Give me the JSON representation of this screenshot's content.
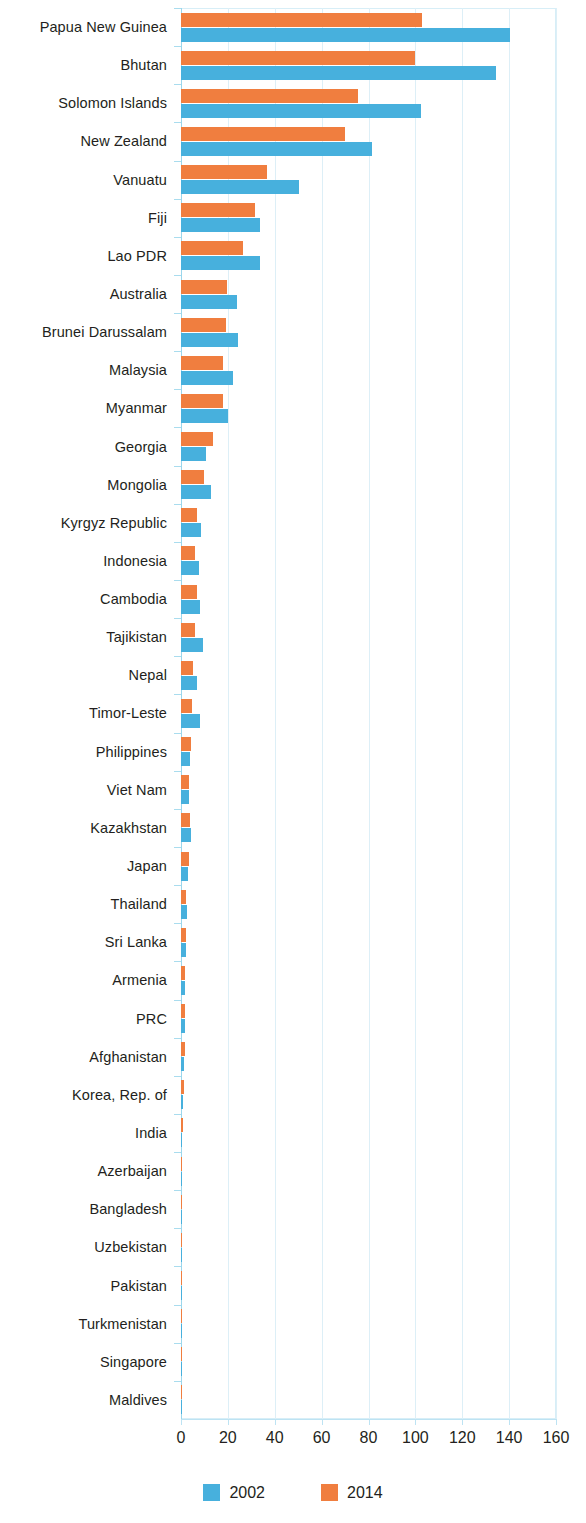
{
  "chart_data": {
    "type": "bar",
    "orientation": "horizontal",
    "title": "",
    "subtitle": "",
    "xlabel": "",
    "ylabel": "",
    "xlim": [
      0,
      160
    ],
    "xticks": [
      0,
      20,
      40,
      60,
      80,
      100,
      120,
      140,
      160
    ],
    "grid": true,
    "legend_position": "bottom",
    "categories": [
      "Papua New Guinea",
      "Bhutan",
      "Solomon Islands",
      "New Zealand",
      "Vanuatu",
      "Fiji",
      "Lao PDR",
      "Australia",
      "Brunei Darussalam",
      "Malaysia",
      "Myanmar",
      "Georgia",
      "Mongolia",
      "Kyrgyz Republic",
      "Indonesia",
      "Cambodia",
      "Tajikistan",
      "Nepal",
      "Timor-Leste",
      "Philippines",
      "Viet Nam",
      "Kazakhstan",
      "Japan",
      "Thailand",
      "Sri Lanka",
      "Armenia",
      "PRC",
      "Afghanistan",
      "Korea, Rep. of",
      "India",
      "Azerbaijan",
      "Bangladesh",
      "Uzbekistan",
      "Pakistan",
      "Turkmenistan",
      "Singapore",
      "Maldives"
    ],
    "series": [
      {
        "name": "2002",
        "color": "#47b0dd",
        "values": [
          140.5,
          134.5,
          102.5,
          81.5,
          50.5,
          33.5,
          33.5,
          24.0,
          24.5,
          22.0,
          20.0,
          10.5,
          13.0,
          8.5,
          7.5,
          8.0,
          9.5,
          7.0,
          8.0,
          4.0,
          3.4,
          4.3,
          3.0,
          2.6,
          2.0,
          1.5,
          1.6,
          1.4,
          0.8,
          0.6,
          0.5,
          0.4,
          0.4,
          0.3,
          0.3,
          0.2,
          0.2
        ]
      },
      {
        "name": "2014",
        "color": "#f07e3f",
        "values": [
          103.0,
          100.0,
          75.5,
          70.0,
          36.5,
          31.5,
          26.5,
          19.5,
          19.0,
          18.0,
          18.0,
          13.5,
          10.0,
          7.0,
          6.0,
          6.8,
          6.0,
          5.3,
          4.9,
          4.3,
          3.4,
          4.0,
          3.2,
          2.3,
          2.0,
          1.8,
          1.6,
          1.5,
          1.2,
          0.7,
          0.6,
          0.5,
          0.5,
          0.4,
          0.4,
          0.3,
          0.4
        ]
      }
    ]
  },
  "legend": {
    "items": [
      {
        "label": "2002",
        "color": "#47b0dd"
      },
      {
        "label": "2014",
        "color": "#f07e3f"
      }
    ]
  },
  "colors": {
    "series_2002": "#47b0dd",
    "series_2014": "#f07e3f",
    "grid": "#ddeff7",
    "axis": "#a9dcee",
    "text": "#231f20"
  }
}
